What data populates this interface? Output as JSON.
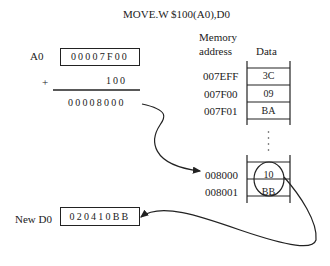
{
  "instruction": "MOVE.W    $100(A0),D0",
  "left": {
    "a0_label": "A0",
    "a0_value": "00007F00",
    "plus_sign": "+",
    "offset": "100",
    "sum": "00008000",
    "d0_label": "New  D0",
    "d0_value": "020410BB"
  },
  "memory": {
    "header_address_line1": "Memory",
    "header_address_line2": "address",
    "header_data": "Data",
    "rows": [
      {
        "address": "007EFF",
        "data": "3C"
      },
      {
        "address": "007F00",
        "data": "09"
      },
      {
        "address": "007F01",
        "data": "BA"
      },
      {
        "address": "008000",
        "data": "10"
      },
      {
        "address": "008001",
        "data": "BB"
      }
    ],
    "ellipsis": "⋮"
  }
}
